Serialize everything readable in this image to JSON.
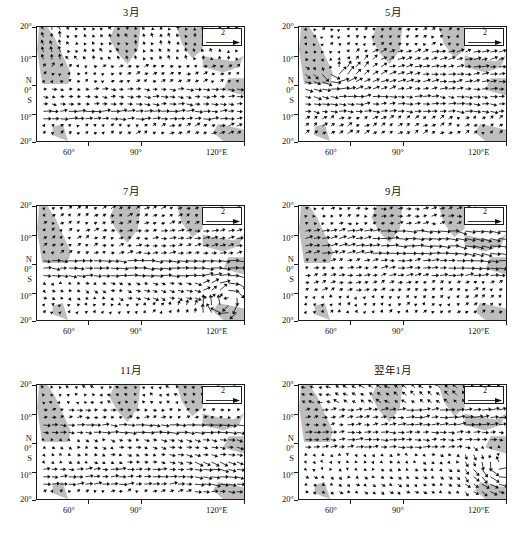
{
  "figure": {
    "kind": "multi-panel wind vector field maps",
    "panel_count": 6,
    "reference_vector_label": "2",
    "axis": {
      "y_labels": [
        "20°",
        "10°",
        "N",
        "0°",
        "S",
        "10°",
        "20°"
      ],
      "x_labels": [
        "60°",
        "90°",
        "120°E"
      ]
    }
  },
  "panels": [
    {
      "title": "3月",
      "legend": "2"
    },
    {
      "title": "5月",
      "legend": "2"
    },
    {
      "title": "7月",
      "legend": "2"
    },
    {
      "title": "9月",
      "legend": "2"
    },
    {
      "title": "11月",
      "legend": "2"
    },
    {
      "title": "翌年1月",
      "legend": "2"
    }
  ],
  "chart_data": {
    "type": "scatter",
    "title": "",
    "xlabel": "",
    "ylabel": "",
    "xlim": [
      40,
      120
    ],
    "ylim": [
      -20,
      20
    ],
    "xticks": [
      60,
      90,
      120
    ],
    "xticklabels": [
      "60°",
      "90°",
      "120°E"
    ],
    "yticks": [
      20,
      10,
      0,
      -10,
      -20
    ],
    "yticklabels": [
      "20°",
      "10°",
      "0°",
      "10°",
      "20°"
    ],
    "grid": false,
    "legend_position": "inside-top-right",
    "reference_vector_magnitude": 2,
    "hemisphere_markers": {
      "north": "N",
      "equator": "0°",
      "south": "S"
    },
    "panels": [
      {
        "title": "3月",
        "description": "March: weak northeasterly flow north of equator, cross-equatorial westerlies near 5°S, strong zonal easterly band near 8°S–12°S",
        "features": [
          "northeast monsoon",
          "equatorial westerly band",
          "southern easterlies"
        ]
      },
      {
        "title": "5月",
        "description": "May: strong cyclonic gyre over western basin near 5°N–10°N, 45°E–60°E; onset westerlies intensify across equator",
        "features": [
          "western boundary gyre",
          "onset westerlies",
          "Somali jet developing"
        ]
      },
      {
        "title": "7月",
        "description": "July: mature southwest monsoon, strong westerly jet along 0°–5°S toward 100°E–110°E, anticyclonic turning near 110°E–15°S",
        "features": [
          "southwest monsoon peak",
          "equatorial westerly jet",
          "southeast anticyclone"
        ]
      },
      {
        "title": "9月",
        "description": "September: broad westerly band 0°–10°N, convergence near 95°E–110°E, weakening western gyre",
        "features": [
          "westerly band",
          "eastern convergence",
          "monsoon retreat onset"
        ]
      },
      {
        "title": "11月",
        "description": "November: transition, easterly return flow north of equator, strong zonal band near 5°N and along 15°S–20°S",
        "features": [
          "monsoon retreat",
          "easterly re-establishment",
          "southern trade band"
        ]
      },
      {
        "title": "翌年1月",
        "description": "Following January: northeast monsoon fully established, strong northeasterlies 5°N–15°N, cross-equatorial flow turning to northwest near 110°E",
        "features": [
          "northeast monsoon",
          "cross-equatorial turning",
          "Australian monsoon inflow"
        ]
      }
    ]
  }
}
